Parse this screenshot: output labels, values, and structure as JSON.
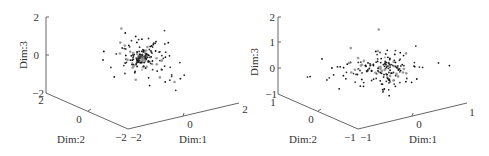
{
  "chart_data": [
    {
      "type": "scatter",
      "title": "",
      "projection": "3d",
      "xlabel": "Dim:1",
      "ylabel": "Dim:2",
      "zlabel": "Dim:3",
      "xlim": [
        -2,
        2
      ],
      "ylim": [
        -2,
        2
      ],
      "zlim": [
        -2,
        2
      ],
      "xticks": [
        "-2",
        "0",
        "2"
      ],
      "yticks": [
        "-2",
        "0",
        "2"
      ],
      "zticks": [
        "-2",
        "0",
        "2"
      ],
      "grid": false,
      "description": "Dense cluster of ~200 points centered near (0,0,0) with spread mostly between -1 and 1 on each dimension; a few outliers up to z≈1.2"
    },
    {
      "type": "scatter",
      "title": "",
      "projection": "3d",
      "xlabel": "Dim:1",
      "ylabel": "Dim:2",
      "zlabel": "Dim:3",
      "xlim": [
        -1,
        1
      ],
      "ylim": [
        -1,
        1
      ],
      "zlim": [
        -1,
        2
      ],
      "xticks": [
        "-1",
        "0",
        "1"
      ],
      "yticks": [
        "-1",
        "0",
        "1"
      ],
      "zticks": [
        "-1",
        "0",
        "1",
        "2"
      ],
      "grid": false,
      "description": "Broader cloud of ~200 points centered near (0,0,0) spanning roughly -1..1 in Dim:1 and Dim:2, z between -0.8 and 1.3"
    }
  ],
  "plots": [
    {
      "z_ticks": [
        "2",
        "0",
        "−2"
      ],
      "y_ticks": [
        "2",
        "0",
        "−2"
      ],
      "x_ticks": [
        "−2",
        "0",
        "2"
      ],
      "xlabel": "Dim:1",
      "ylabel": "Dim:2",
      "zlabel": "Dim:3"
    },
    {
      "z_ticks": [
        "2",
        "1",
        "0",
        "−1"
      ],
      "y_ticks": [
        "1",
        "0",
        "−1"
      ],
      "x_ticks": [
        "−1",
        "0",
        "1"
      ],
      "xlabel": "Dim:1",
      "ylabel": "Dim:2",
      "zlabel": "Dim:3"
    }
  ]
}
